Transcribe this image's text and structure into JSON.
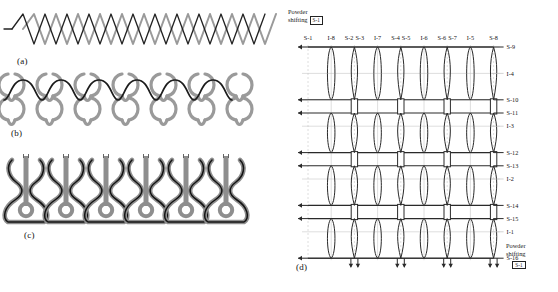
{
  "figure": {
    "background": "#ffffff"
  },
  "panels": [
    {
      "id": "a",
      "label": "(a)",
      "caption": "zigzag diamond yarn path, two overlapping chains",
      "type": "zigzag-chain",
      "repeats": 11,
      "colors": {
        "front": "#222222",
        "back": "#9a9a9a"
      }
    },
    {
      "id": "b",
      "label": "(b)",
      "caption": "interlocking loop rows with black course path",
      "type": "loop-rows",
      "repeats": 6,
      "rows": 2,
      "colors": {
        "front": "#1c1c1c",
        "back": "#9a9a9a"
      }
    },
    {
      "id": "c",
      "label": "(c)",
      "caption": "guitar-shaped loop cells with black outline",
      "type": "loop-cells",
      "repeats": 6,
      "colors": {
        "front": "#141414",
        "back": "#8e8e8e"
      }
    },
    {
      "id": "d",
      "label": "(d)",
      "caption": "needle-bed lattice diagram with stitch and intarsia labels",
      "type": "lattice",
      "colors": {
        "stroke": "#2a2a2a",
        "grid": "#c2c2c2"
      }
    }
  ],
  "lattice": {
    "columns": 9,
    "rows": 12,
    "top_labels": [
      "S-1",
      "I-8",
      "S-2",
      "S-3",
      "I-7",
      "S-4",
      "S-5",
      "I-6",
      "S-6",
      "S-7",
      "I-5",
      "S-8"
    ],
    "top_label_groups": [
      {
        "text": "S-1",
        "col": 0
      },
      {
        "text": "I-8",
        "col": 1
      },
      {
        "text": "S-2",
        "col": 2,
        "pair": "S-3"
      },
      {
        "text": "I-7",
        "col": 3
      },
      {
        "text": "S-4",
        "col": 4,
        "pair": "S-5"
      },
      {
        "text": "I-6",
        "col": 5
      },
      {
        "text": "S-6",
        "col": 6,
        "pair": "S-7"
      },
      {
        "text": "I-5",
        "col": 7
      },
      {
        "text": "S-8",
        "col": 8
      }
    ],
    "right_labels": [
      {
        "text": "S-9",
        "row": 0
      },
      {
        "text": "I-4",
        "row": 2
      },
      {
        "text": "S-10",
        "row": 4
      },
      {
        "text": "S-11",
        "row": 5
      },
      {
        "text": "I-3",
        "row": 6
      },
      {
        "text": "S-12",
        "row": 8
      },
      {
        "text": "S-13",
        "row": 9
      },
      {
        "text": "I-2",
        "row": 10
      },
      {
        "text": "S-14",
        "row": 12
      },
      {
        "text": "S-15",
        "row": 13
      },
      {
        "text": "I-1",
        "row": 14
      },
      {
        "text": "S-16",
        "row": 16
      }
    ],
    "powder_shifting_top": {
      "line1": "Powder",
      "line2": "shifting",
      "box_label": "S-1"
    },
    "powder_shifting_bottom": {
      "line1": "Powder",
      "line2": "shifting",
      "box_label": "S-1"
    }
  }
}
